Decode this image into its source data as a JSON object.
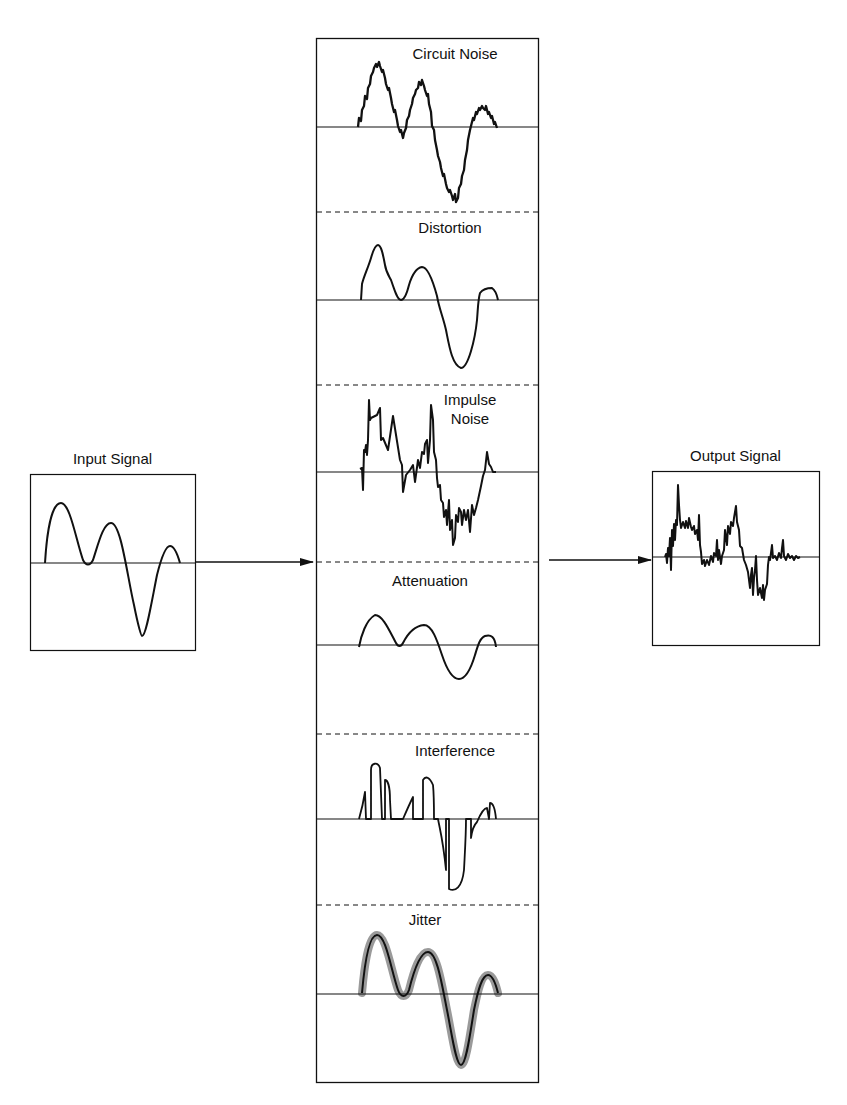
{
  "diagram": {
    "title": "",
    "input": {
      "label": "Input Signal"
    },
    "output": {
      "label": "Output Signal"
    },
    "impairments": [
      {
        "label": "Circuit Noise"
      },
      {
        "label": "Distortion"
      },
      {
        "label_line1": "Impulse",
        "label_line2": "Noise"
      },
      {
        "label": "Attenuation"
      },
      {
        "label": "Interference"
      },
      {
        "label": "Jitter"
      }
    ],
    "colors": {
      "line": "#111111",
      "jitter_halo": "#9a9a9a",
      "background": "#ffffff"
    }
  }
}
